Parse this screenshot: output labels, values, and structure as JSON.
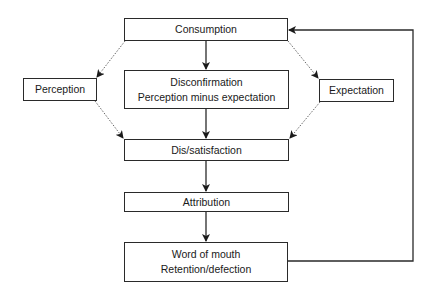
{
  "diagram": {
    "type": "flowchart",
    "nodes": {
      "consumption": {
        "lines": [
          "Consumption"
        ]
      },
      "perception": {
        "lines": [
          "Perception"
        ]
      },
      "disconfirmation": {
        "lines": [
          "Disconfirmation",
          "Perception minus expectation"
        ]
      },
      "expectation": {
        "lines": [
          "Expectation"
        ]
      },
      "dissatisfaction": {
        "lines": [
          "Dis/satisfaction"
        ]
      },
      "attribution": {
        "lines": [
          "Attribution"
        ]
      },
      "word_of_mouth": {
        "lines": [
          "Word of mouth",
          "Retention/defection"
        ]
      }
    },
    "edges": [
      {
        "from": "Consumption",
        "to": "Disconfirmation",
        "style": "solid"
      },
      {
        "from": "Consumption",
        "to": "Perception",
        "style": "dotted"
      },
      {
        "from": "Consumption",
        "to": "Expectation",
        "style": "dotted"
      },
      {
        "from": "Perception",
        "to": "Dis/satisfaction",
        "style": "dotted"
      },
      {
        "from": "Expectation",
        "to": "Dis/satisfaction",
        "style": "dotted"
      },
      {
        "from": "Disconfirmation",
        "to": "Dis/satisfaction",
        "style": "solid"
      },
      {
        "from": "Dis/satisfaction",
        "to": "Attribution",
        "style": "solid"
      },
      {
        "from": "Attribution",
        "to": "Word of mouth",
        "style": "solid"
      },
      {
        "from": "Word of mouth",
        "to": "Consumption",
        "style": "solid",
        "route": "feedback-loop-right"
      }
    ],
    "colors": {
      "line": "#2a2a2a",
      "dotted": "#555555",
      "background": "#ffffff"
    }
  }
}
